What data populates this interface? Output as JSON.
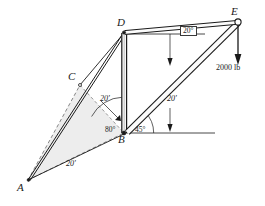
{
  "figure": {
    "type": "engineering-truss-free-body-diagram",
    "canvas": {
      "width": 265,
      "height": 206
    },
    "background_color": "#ffffff",
    "line_color": "#1a1a1a",
    "shade_color": "#ededed"
  },
  "joints": [
    {
      "id": "A",
      "label": "A",
      "x": 28,
      "y": 180
    },
    {
      "id": "B",
      "label": "B",
      "x": 124,
      "y": 133
    },
    {
      "id": "C",
      "label": "C",
      "x": 80,
      "y": 85
    },
    {
      "id": "D",
      "label": "D",
      "x": 124,
      "y": 32
    },
    {
      "id": "E",
      "label": "E",
      "x": 237,
      "y": 22
    }
  ],
  "point_labels": {
    "a": "A",
    "b": "B",
    "c": "C",
    "d": "D",
    "e": "E"
  },
  "dimensions": {
    "ab_length": "20'",
    "bd_length": "20'",
    "be_length": "20'"
  },
  "angles": {
    "at_b_left": "80°",
    "at_b_right": "45°",
    "at_d_top": "20°"
  },
  "load": {
    "magnitude": "2000 lb",
    "direction": "down",
    "applied_at": "E"
  }
}
